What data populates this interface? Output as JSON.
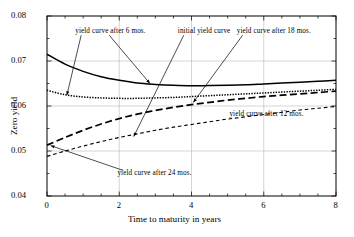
{
  "chart_data": {
    "type": "line",
    "title": "",
    "xlabel": "Time to maturity in years",
    "ylabel": "Zero yield",
    "xlim": [
      0,
      8
    ],
    "ylim": [
      0.04,
      0.08
    ],
    "xticks": [
      "0",
      "2",
      "4",
      "6",
      "8"
    ],
    "xtick_values": [
      0,
      2,
      4,
      6,
      8
    ],
    "yticks": [
      "0.04",
      "0.05",
      "0.06",
      "0.07",
      "0.08"
    ],
    "ytick_values": [
      0.04,
      0.05,
      0.06,
      0.07,
      0.08
    ],
    "grid": true,
    "legend_position": "inline-annotations",
    "x": [
      0,
      0.5,
      1,
      1.5,
      2,
      2.5,
      3,
      3.5,
      4,
      4.5,
      5,
      5.5,
      6,
      6.5,
      7,
      7.5,
      8
    ],
    "series": [
      {
        "name": "initial yield curve",
        "style": "solid",
        "values": [
          0.0715,
          0.0693,
          0.0677,
          0.0665,
          0.0657,
          0.0651,
          0.0648,
          0.0646,
          0.0645,
          0.06455,
          0.0646,
          0.0647,
          0.0649,
          0.0651,
          0.0653,
          0.0655,
          0.0657
        ]
      },
      {
        "name": "yield curve after 6 mos.",
        "style": "dotted",
        "values": [
          0.0635,
          0.0625,
          0.062,
          0.0618,
          0.0617,
          0.0617,
          0.0618,
          0.0619,
          0.0621,
          0.0623,
          0.0625,
          0.0627,
          0.0629,
          0.0631,
          0.0633,
          0.0635,
          0.0637
        ]
      },
      {
        "name": "yield curve after 18 mos.",
        "style": "long-dash",
        "values": [
          0.0513,
          0.053,
          0.0546,
          0.056,
          0.0572,
          0.0582,
          0.059,
          0.0597,
          0.0603,
          0.0608,
          0.0613,
          0.0617,
          0.0621,
          0.0624,
          0.0627,
          0.063,
          0.0633
        ]
      },
      {
        "name": "yield curve after 12 mos.",
        "style": "short-dash",
        "values": [
          0.0488,
          0.05,
          0.0511,
          0.0521,
          0.053,
          0.0538,
          0.0546,
          0.0553,
          0.0559,
          0.0565,
          0.0571,
          0.0576,
          0.0581,
          0.0586,
          0.0591,
          0.0595,
          0.0599
        ]
      }
    ],
    "annotations": [
      {
        "id": "ann-6mos",
        "text": "yield curve after 6 mos.",
        "label_x": 0.78,
        "label_y": 0.0764,
        "leaders": [
          {
            "to_x": 0.55,
            "to_y": 0.0624
          },
          {
            "to_x": 2.85,
            "to_y": 0.065
          }
        ]
      },
      {
        "id": "ann-initial",
        "text": "initial yield curve",
        "label_x": 3.62,
        "label_y": 0.0764,
        "leaders": [
          {
            "to_x": 2.4,
            "to_y": 0.0532
          }
        ]
      },
      {
        "id": "ann-18mos",
        "text": "yield curve after 18 mos.",
        "label_x": 5.25,
        "label_y": 0.0764,
        "leaders": [
          {
            "to_x": 4.05,
            "to_y": 0.0608
          }
        ]
      },
      {
        "id": "ann-12mos",
        "text": "yield curve after 12 mos.",
        "label_x": 5.05,
        "label_y": 0.058,
        "leaders": []
      },
      {
        "id": "ann-24mos",
        "text": "yield curve after 24 mos.",
        "label_x": 1.95,
        "label_y": 0.045,
        "leaders": [
          {
            "to_x": 0.1,
            "to_y": 0.0512
          }
        ]
      }
    ],
    "colors": {
      "line": "#000000",
      "grid": "#b9b9b9",
      "axis": "#000000",
      "background": "#ffffff"
    }
  }
}
